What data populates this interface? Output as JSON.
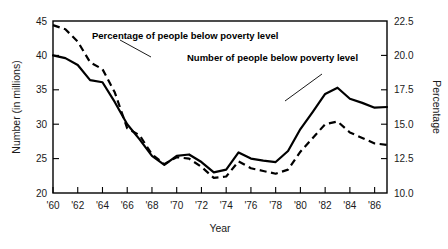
{
  "chart_data": {
    "type": "line",
    "title": "",
    "xlabel": "Year",
    "ylabel": "Number (in millions)",
    "y2label": "Percentage",
    "grid": false,
    "legend_position": "inline-annotations",
    "xlim": [
      1960,
      1987
    ],
    "ylim": [
      20,
      45
    ],
    "y2lim": [
      10.0,
      22.5
    ],
    "xticks": [
      "'60",
      "'62",
      "'64",
      "'66",
      "'68",
      "'70",
      "'72",
      "'74",
      "'76",
      "'78",
      "'80",
      "'82",
      "'84",
      "'86"
    ],
    "xtick_values": [
      1960,
      1962,
      1964,
      1966,
      1968,
      1970,
      1972,
      1974,
      1976,
      1978,
      1980,
      1982,
      1984,
      1986
    ],
    "yticks": [
      "20",
      "25",
      "30",
      "35",
      "40",
      "45"
    ],
    "ytick_values": [
      20,
      25,
      30,
      35,
      40,
      45
    ],
    "y2ticks": [
      "10.0",
      "12.5",
      "15.0",
      "17.5",
      "20.0",
      "22.5"
    ],
    "y2tick_values": [
      10.0,
      12.5,
      15.0,
      17.5,
      20.0,
      22.5
    ],
    "x": [
      1960,
      1961,
      1962,
      1963,
      1964,
      1965,
      1966,
      1967,
      1968,
      1969,
      1970,
      1971,
      1972,
      1973,
      1974,
      1975,
      1976,
      1977,
      1978,
      1979,
      1980,
      1981,
      1982,
      1983,
      1984,
      1985,
      1986,
      1987
    ],
    "series": [
      {
        "name": "Number of people below poverty level",
        "style": "solid",
        "axis": "left",
        "units": "millions",
        "values": [
          40.0,
          39.6,
          38.6,
          36.4,
          36.1,
          33.2,
          30.0,
          27.8,
          25.4,
          24.1,
          25.4,
          25.6,
          24.5,
          23.0,
          23.4,
          25.9,
          25.0,
          24.7,
          24.5,
          26.1,
          29.3,
          31.8,
          34.4,
          35.3,
          33.7,
          33.1,
          32.4,
          32.5
        ]
      },
      {
        "name": "Percentage of people below poverty level",
        "style": "dashed",
        "axis": "right",
        "units": "percent",
        "values": [
          22.2,
          21.9,
          21.0,
          19.5,
          19.0,
          17.3,
          14.7,
          14.2,
          12.8,
          12.1,
          12.6,
          12.5,
          11.9,
          11.1,
          11.2,
          12.3,
          11.8,
          11.6,
          11.4,
          11.7,
          13.0,
          14.0,
          15.0,
          15.2,
          14.4,
          14.0,
          13.6,
          13.5
        ]
      }
    ],
    "annotations": [
      {
        "text": "Percentage of people below poverty level",
        "points_to_series": "Percentage of people below poverty level",
        "points_to_x": 1965
      },
      {
        "text": "Number of people below poverty level",
        "points_to_series": "Number of people below poverty level",
        "points_to_x": 1980
      }
    ]
  }
}
